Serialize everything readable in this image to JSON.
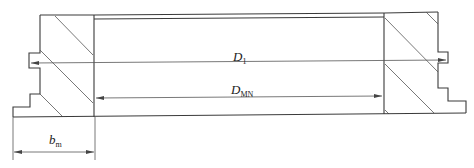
{
  "diagram": {
    "type": "cross-section-dimension-drawing",
    "labels": {
      "d1": {
        "main": "D",
        "sub": "1"
      },
      "dmn": {
        "main": "D",
        "sub": "MN"
      },
      "bm": {
        "main": "b",
        "sub": "m"
      }
    },
    "dimensions": [
      {
        "name": "D1",
        "description": "outer diameter across notches",
        "from": "left notch",
        "to": "right notch"
      },
      {
        "name": "DMN",
        "description": "inner bore diameter",
        "from": "left inner wall",
        "to": "right inner wall"
      },
      {
        "name": "bm",
        "description": "wall/section width",
        "from": "left base edge",
        "to": "left inner wall"
      }
    ],
    "colors": {
      "line": "#3a3a3a",
      "background": "#ffffff"
    }
  }
}
